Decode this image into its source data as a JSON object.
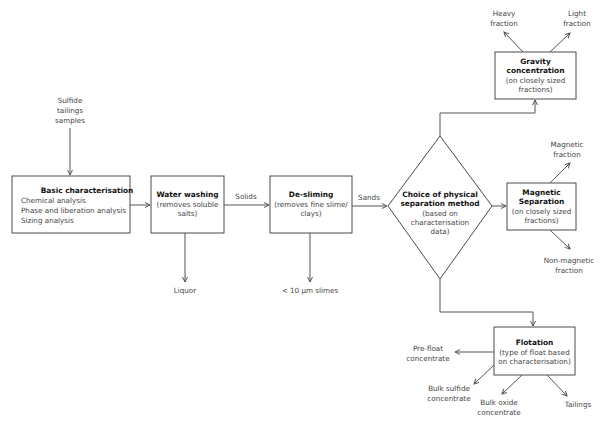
{
  "diagram": {
    "input": {
      "lines": [
        "Sulfide",
        "tailings",
        "samples"
      ]
    },
    "basic": {
      "title": "Basic characterisation",
      "lines": [
        "Chemical analysis",
        "Phase and liberation analysis",
        "Sizing analysis"
      ]
    },
    "water": {
      "title": "Water washing",
      "lines": [
        "(removes soluble",
        "salts)"
      ]
    },
    "water_out": "Liquor",
    "edge_solids": "Solids",
    "desliming": {
      "title": "De-sliming",
      "lines": [
        "(removes fine slime/",
        "clays)"
      ]
    },
    "desliming_out": "< 10 µm slimes",
    "edge_sands": "Sands",
    "decision": {
      "title_lines": [
        "Choice of physical",
        "separation method"
      ],
      "lines": [
        "(based on",
        "characterisation",
        "data)"
      ]
    },
    "gravity": {
      "title_lines": [
        "Gravity",
        "concentration"
      ],
      "lines": [
        "(on closely sized",
        "fractions)"
      ]
    },
    "gravity_out": [
      {
        "lines": [
          "Heavy",
          "fraction"
        ]
      },
      {
        "lines": [
          "Light",
          "fraction"
        ]
      }
    ],
    "magnetic": {
      "title_lines": [
        "Magnetic",
        "Separation"
      ],
      "lines": [
        "(on closely sized",
        "fractions)"
      ]
    },
    "magnetic_out": [
      {
        "lines": [
          "Magnetic",
          "fraction"
        ]
      },
      {
        "lines": [
          "Non-magnetic",
          "fraction"
        ]
      }
    ],
    "flotation": {
      "title": "Flotation",
      "lines": [
        "(type of float based",
        "on characterisation)"
      ]
    },
    "flotation_out": [
      {
        "lines": [
          "Pre-float",
          "concentrate"
        ]
      },
      {
        "lines": [
          "Bulk sulfide",
          "concentrate"
        ]
      },
      {
        "lines": [
          "Bulk oxide",
          "concentrate"
        ]
      },
      {
        "lines": [
          "Tailings"
        ]
      }
    ],
    "colors": {
      "stroke": "#4a4a4a",
      "text": "#444444",
      "title": "#111111"
    }
  }
}
